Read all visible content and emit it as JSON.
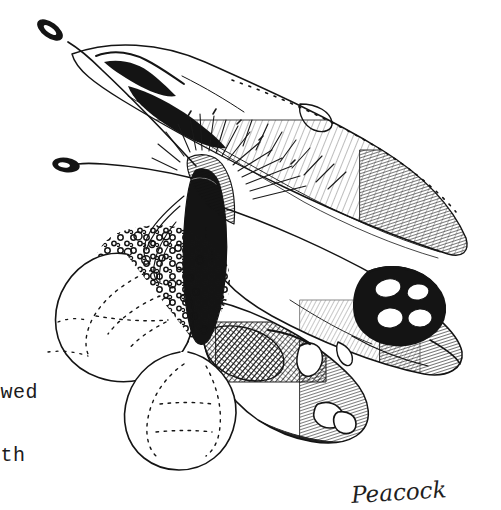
{
  "page": {
    "width": 501,
    "height": 510,
    "background_color": "#ffffff",
    "ink_color": "#141414"
  },
  "artwork": {
    "subject": "Peacock butterfly on flower",
    "medium": "pen and ink line drawing",
    "description": "Butterfly with hatched wings, clubbed antennae, hairy thorax, and an ocellus eyespot, perched on a stippled flower head",
    "parts": [
      {
        "name": "left-antenna",
        "label": "antenna with clubbed tip"
      },
      {
        "name": "right-antenna",
        "label": "antenna with clubbed tip"
      },
      {
        "name": "forewing",
        "label": "forewing with fine hatching"
      },
      {
        "name": "hindwing",
        "label": "hindwing with eyespot"
      },
      {
        "name": "eyespot",
        "label": "ocellus with white patches"
      },
      {
        "name": "thorax",
        "label": "hairy thorax and bristles"
      },
      {
        "name": "proboscis",
        "label": "coiled proboscis"
      },
      {
        "name": "flower-head",
        "label": "stippled flower head"
      },
      {
        "name": "petal-left",
        "label": "flower petal"
      },
      {
        "name": "petal-lower",
        "label": "flower petal"
      }
    ]
  },
  "captions": {
    "typed_lines": [
      "owed",
      "ith"
    ],
    "handwritten_label": "Peacock"
  }
}
